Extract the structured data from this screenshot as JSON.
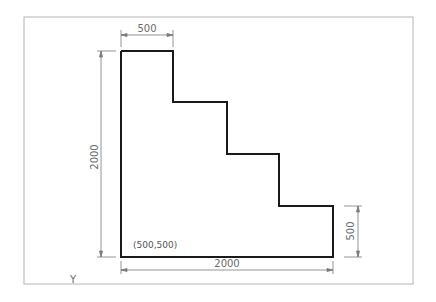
{
  "drawing": {
    "frame": {
      "x": 24,
      "y": 17,
      "width": 389,
      "height": 267,
      "color": "#b4b4b4"
    },
    "shape": {
      "stroke": "#1a1a1a",
      "points": [
        [
          121,
          51
        ],
        [
          173,
          51
        ],
        [
          173,
          102
        ],
        [
          227,
          102
        ],
        [
          227,
          154
        ],
        [
          279,
          154
        ],
        [
          279,
          206
        ],
        [
          333,
          206
        ],
        [
          333,
          257
        ],
        [
          121,
          257
        ]
      ]
    },
    "dimensions": {
      "top_width": "500",
      "left_height": "2000",
      "bottom_width": "2000",
      "right_height": "500"
    },
    "origin_label": "(500,500)",
    "axis_label": "Y",
    "dim_color": "#7a7a7a"
  }
}
